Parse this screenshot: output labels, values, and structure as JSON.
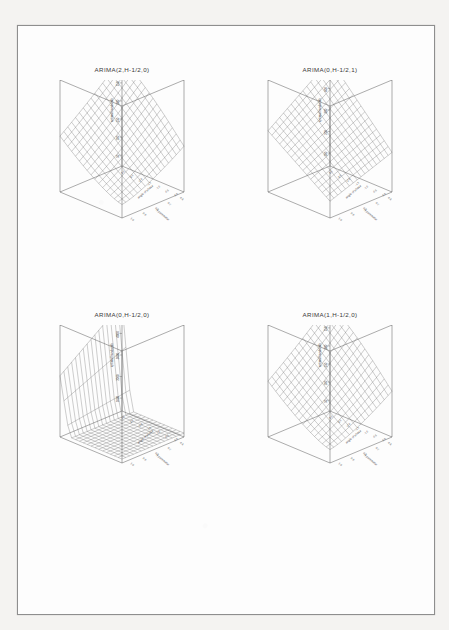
{
  "page": {
    "background_color": "#f4f3f1",
    "sheet_color": "#fdfdfd",
    "border_color": "#8e8e8e"
  },
  "figure": {
    "kind": "scanned-page-of-3d-surface-plots",
    "panel_count": 4,
    "layout": "2x2"
  },
  "panels": [
    {
      "id": "arima-2-0",
      "title": "ARIMA(2,H-1/2,0)",
      "chart_data": {
        "type": "surface",
        "title": "ARIMA(2,H-1/2,0)",
        "zlabel": "optimal bandwidth",
        "xlabel": "angle of phase",
        "ylabel": "H parameter",
        "zticks": [
          "50",
          "100",
          "150",
          "200",
          "250",
          "300"
        ],
        "xticks": [
          "-3.0",
          "-2.5",
          "-2.0",
          "-1.5",
          "-1.0",
          "-0.5",
          "0.0"
        ],
        "yticks": [
          "0.6",
          "0.7",
          "0.8",
          "0.9",
          "1.0"
        ],
        "zlim": [
          50,
          300
        ],
        "shape": "monotone-ramp-descending-front-right",
        "mesh_rows": 17,
        "mesh_cols": 17,
        "grid": true
      }
    },
    {
      "id": "arima-0-1",
      "title": "ARIMA(0,H-1/2,1)",
      "chart_data": {
        "type": "surface",
        "title": "ARIMA(0,H-1/2,1)",
        "zlabel": "optimal bandwidth",
        "xlabel": "angle of phase",
        "ylabel": "H parameter",
        "zticks": [
          "100",
          "200",
          "300",
          "400",
          "500"
        ],
        "xticks": [
          "-3.0",
          "-2.5",
          "-2.0",
          "-1.5",
          "-1.0",
          "-0.5",
          "0.0"
        ],
        "yticks": [
          "0.6",
          "0.7",
          "0.8",
          "0.9",
          "1.0"
        ],
        "zlim": [
          100,
          500
        ],
        "shape": "saddle-plane-tilted",
        "mesh_rows": 17,
        "mesh_cols": 17,
        "grid": true
      }
    },
    {
      "id": "arima-0-0",
      "title": "ARIMA(0,H-1/2,0)",
      "chart_data": {
        "type": "surface",
        "title": "ARIMA(0,H-1/2,0)",
        "zlabel": "optimal bandwidth",
        "xlabel": "angle of phase",
        "ylabel": "H parameter",
        "zticks": [
          "1000",
          "2000",
          "3000",
          "4000",
          "5000"
        ],
        "xticks": [
          "-3.0",
          "-2.5",
          "-2.0",
          "-1.5",
          "-1.0",
          "-0.5",
          "0.0"
        ],
        "yticks": [
          "0.6",
          "0.7",
          "0.8",
          "0.9",
          "1.0"
        ],
        "zlim": [
          0,
          5000
        ],
        "shape": "sharp-cliff-at-left-edge-flat-plateau",
        "mesh_rows": 17,
        "mesh_cols": 17,
        "grid": true
      }
    },
    {
      "id": "arima-1-0",
      "title": "ARIMA(1,H-1/2,0)",
      "chart_data": {
        "type": "surface",
        "title": "ARIMA(1,H-1/2,0)",
        "zlabel": "optimal bandwidth",
        "xlabel": "angle of phase",
        "ylabel": "H parameter",
        "zticks": [
          "50",
          "100",
          "150",
          "200",
          "250",
          "300"
        ],
        "xticks": [
          "-3.0",
          "-2.5",
          "-2.0",
          "-1.5",
          "-1.0",
          "-0.5",
          "0.0"
        ],
        "yticks": [
          "0.6",
          "0.7",
          "0.8",
          "0.9",
          "1.0"
        ],
        "zlim": [
          50,
          300
        ],
        "shape": "monotone-ramp-descending-front-right",
        "mesh_rows": 17,
        "mesh_cols": 17,
        "grid": true
      }
    }
  ]
}
